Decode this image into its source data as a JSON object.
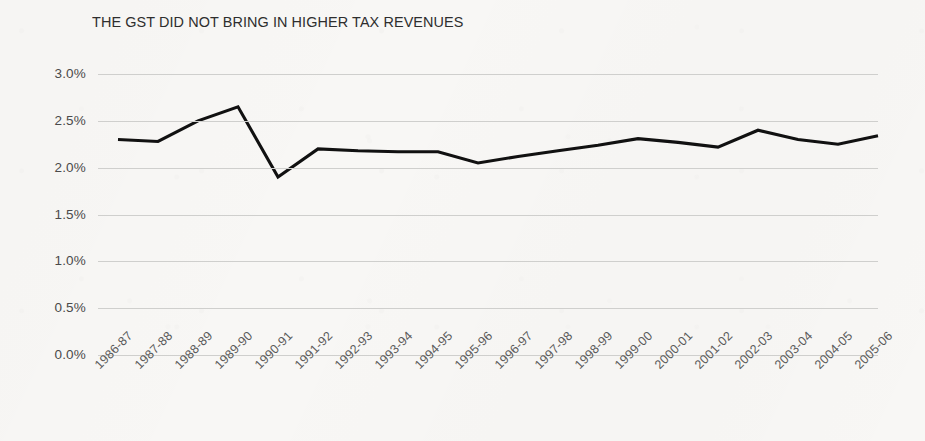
{
  "chart_data": {
    "type": "line",
    "title": "THE GST DID NOT BRING IN HIGHER TAX REVENUES",
    "xlabel": "",
    "ylabel": "",
    "categories": [
      "1986-87",
      "1987-88",
      "1988-89",
      "1989-90",
      "1990-91",
      "1991-92",
      "1992-93",
      "1993-94",
      "1994-95",
      "1995-96",
      "1996-97",
      "1997-98",
      "1998-99",
      "1999-00",
      "2000-01",
      "2001-02",
      "2002-03",
      "2003-04",
      "2004-05",
      "2005-06"
    ],
    "values": [
      2.3,
      2.28,
      2.5,
      2.65,
      1.9,
      2.2,
      2.18,
      2.17,
      2.17,
      2.05,
      2.12,
      2.18,
      2.24,
      2.31,
      2.27,
      2.22,
      2.4,
      2.3,
      2.25,
      2.34
    ],
    "ytick_labels": [
      "3.0%",
      "2.5%",
      "2.0%",
      "1.5%",
      "1.0%",
      "0.5%",
      "0.0%"
    ],
    "ytick_values": [
      3.0,
      2.5,
      2.0,
      1.5,
      1.0,
      0.5,
      0.0
    ],
    "ylim": [
      0.0,
      3.0
    ],
    "grid": true,
    "legend": null,
    "series_color": "#111111",
    "gridline_color": "#cfcfcd",
    "background_color": "#f8f7f5",
    "title_color": "#2e2e2e",
    "tick_label_color": "#4a4a4a"
  }
}
